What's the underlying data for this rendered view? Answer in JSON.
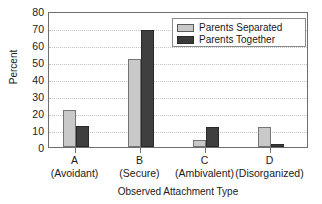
{
  "chart_data": {
    "type": "bar",
    "title": "",
    "xlabel": "Observed Attachment Type",
    "ylabel": "Percent",
    "ylim": [
      0,
      80
    ],
    "ytick_step": 10,
    "yticks": [
      "0",
      "10",
      "20",
      "30",
      "40",
      "50",
      "60",
      "70",
      "80"
    ],
    "grid": true,
    "legend_position": "top-right",
    "categories": [
      "A",
      "B",
      "C",
      "D"
    ],
    "category_sublabels": [
      "(Avoidant)",
      "(Secure)",
      "(Ambivalent)",
      "(Disorganized)"
    ],
    "series": [
      {
        "name": "Parents Separated",
        "color": "#c9c9c9",
        "values": [
          21.5,
          52,
          4,
          12
        ]
      },
      {
        "name": "Parents Together",
        "color": "#3f3f3f",
        "values": [
          12.5,
          69,
          12,
          1.5
        ]
      }
    ]
  },
  "legend": {
    "items": [
      {
        "label": "Parents Separated",
        "swatch": "light"
      },
      {
        "label": "Parents Together",
        "swatch": "dark"
      }
    ]
  }
}
